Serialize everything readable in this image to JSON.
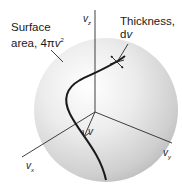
{
  "labels": {
    "surface_area_line1": "Surface",
    "surface_area_line2_prefix": "area, 4",
    "surface_area_pi": "π",
    "surface_area_var": "v",
    "surface_area_exp": "2",
    "thickness_line1": "Thickness,",
    "thickness_line2_prefix": "d",
    "thickness_line2_var": "v",
    "axis_z_main": "v",
    "axis_z_sub": "z",
    "axis_y_main": "v",
    "axis_y_sub": "y",
    "axis_x_main": "v",
    "axis_x_sub": "x",
    "vector_label": "v"
  },
  "colors": {
    "sphere_highlight": "#ffffff",
    "sphere_mid": "#e4e4e4",
    "sphere_shadow": "#b8b8b8",
    "line": "#1a1a1a"
  }
}
